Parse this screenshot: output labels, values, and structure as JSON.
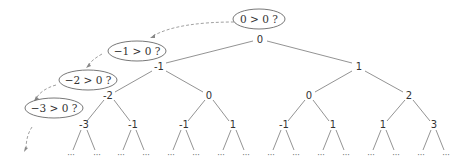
{
  "diagram": {
    "type": "binary-search-tree",
    "colors": {
      "line": "#777777",
      "text": "#333333",
      "dashed": "#888888"
    },
    "nodes": {
      "root": "0",
      "l1": [
        "-1",
        "1"
      ],
      "l2": [
        "-2",
        "0",
        "0",
        "2"
      ],
      "l3": [
        "-3",
        "-1",
        "-1",
        "1",
        "-1",
        "1",
        "1",
        "3"
      ]
    },
    "questions": [
      "0 > 0 ?",
      "−1 > 0 ?",
      "−2 > 0 ?",
      "−3 > 0 ?"
    ],
    "ellipsis": "···"
  }
}
